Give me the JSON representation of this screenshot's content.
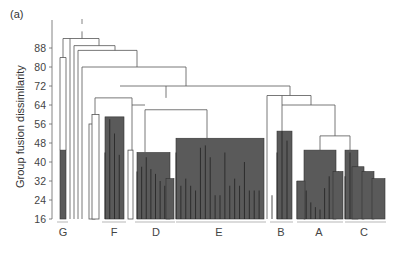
{
  "chart_data": {
    "type": "dendrogram",
    "panel_label": "(a)",
    "title": "",
    "xlabel": "",
    "ylabel": "Group fusion dissimilarity",
    "yticks": [
      16,
      24,
      32,
      40,
      48,
      56,
      64,
      72,
      80,
      88
    ],
    "ylim": [
      16,
      96
    ],
    "groups": [
      {
        "name": "G",
        "x_center": 63
      },
      {
        "name": "F",
        "x_center": 114
      },
      {
        "name": "D",
        "x_center": 156
      },
      {
        "name": "E",
        "x_center": 219
      },
      {
        "name": "B",
        "x_center": 281
      },
      {
        "name": "A",
        "x_center": 319
      },
      {
        "name": "C",
        "x_center": 364
      }
    ],
    "major_fusions": [
      {
        "label": "root",
        "height": 95
      },
      {
        "label": "G + rest",
        "height": 93
      },
      {
        "label": "singleton merge",
        "height": 91
      },
      {
        "label": "singleton merge",
        "height": 87
      },
      {
        "label": "singleton merge",
        "height": 80
      },
      {
        "label": "F/D/E + B/A/C",
        "height": 72
      },
      {
        "label": "B + A/C",
        "height": 66
      },
      {
        "label": "F-cluster + D/E",
        "height": 67
      },
      {
        "label": "D + E",
        "height": 62
      },
      {
        "label": "A + C",
        "height": 50
      },
      {
        "label": "A/C internal",
        "height": 47
      }
    ],
    "colors": {
      "filled_cluster": "#5a5a5a",
      "line": "#555555",
      "background": "#ffffff"
    }
  }
}
